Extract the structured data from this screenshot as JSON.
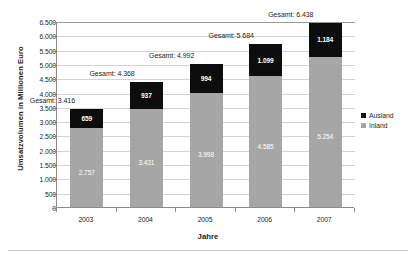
{
  "chart_data": {
    "type": "bar",
    "subtype": "stacked-column",
    "title": "",
    "xlabel": "Jahre",
    "ylabel": "Umsatzvolumen in Millionen Euro",
    "categories": [
      "2003",
      "2004",
      "2005",
      "2006",
      "2007"
    ],
    "series": [
      {
        "name": "Inland",
        "color": "#a6a6a6",
        "values": [
          2757,
          3431,
          3998,
          4585,
          5254
        ],
        "labels": [
          "2.757",
          "3.431",
          "3.998",
          "4.585",
          "5.254"
        ]
      },
      {
        "name": "Ausland",
        "color": "#0d0d0d",
        "values": [
          659,
          937,
          994,
          1099,
          1184
        ],
        "labels": [
          "659",
          "937",
          "994",
          "1.099",
          "1.184"
        ]
      }
    ],
    "totals": [
      3416,
      4368,
      4992,
      5684,
      6438
    ],
    "total_labels": [
      "Gesamt: 3.416",
      "Gesamt: 4.368",
      "Gesamt: 4.992",
      "Gesamt: 5.684",
      "Gesamt: 6.438"
    ],
    "ylim": [
      0,
      6500
    ],
    "ytick_step": 500,
    "ytick_labels": [
      "6.500",
      "6.000",
      "5.500",
      "5.000",
      "4.500",
      "4.000",
      "3.500",
      "3.000",
      "2.500",
      "2.000",
      "1.500",
      "1.000",
      "500",
      "0"
    ],
    "ytick_values": [
      6500,
      6000,
      5500,
      5000,
      4500,
      4000,
      3500,
      3000,
      2500,
      2000,
      1500,
      1000,
      500,
      0
    ],
    "grid": true,
    "legend_position": "right",
    "legend": [
      {
        "label": "Ausland",
        "color": "#0d0d0d"
      },
      {
        "label": "Inland",
        "color": "#a6a6a6"
      }
    ]
  }
}
